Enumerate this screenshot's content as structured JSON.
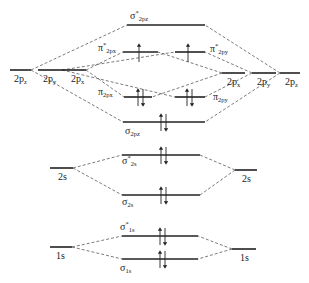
{
  "diagram": {
    "type": "molecular orbital energy-level diagram",
    "atomic_orbitals_left": [
      {
        "id": "L2pz",
        "label": "2p",
        "sub": "z"
      },
      {
        "id": "L2py",
        "label": "2p",
        "sub": "y"
      },
      {
        "id": "L2px",
        "label": "2p",
        "sub": "x"
      },
      {
        "id": "L2s",
        "label": "2s",
        "sub": ""
      },
      {
        "id": "L1s",
        "label": "1s",
        "sub": ""
      }
    ],
    "atomic_orbitals_right": [
      {
        "id": "R2px",
        "label": "2p",
        "sub": "x"
      },
      {
        "id": "R2py",
        "label": "2p",
        "sub": "y"
      },
      {
        "id": "R2pz",
        "label": "2p",
        "sub": "z"
      },
      {
        "id": "R2s",
        "label": "2s",
        "sub": ""
      },
      {
        "id": "R1s",
        "label": "1s",
        "sub": ""
      }
    ],
    "molecular_orbitals": [
      {
        "id": "sigma_star_2pz",
        "symbol": "σ",
        "star": "*",
        "sub": "2pz",
        "electrons": 0
      },
      {
        "id": "pi_star_2px",
        "symbol": "π",
        "star": "*",
        "sub": "2px",
        "electrons": 1
      },
      {
        "id": "pi_star_2py",
        "symbol": "π",
        "star": "*",
        "sub": "2py",
        "electrons": 1
      },
      {
        "id": "pi_2px",
        "symbol": "π",
        "star": "",
        "sub": "2px",
        "electrons": 2
      },
      {
        "id": "pi_2py",
        "symbol": "π",
        "star": "",
        "sub": "2py",
        "electrons": 2
      },
      {
        "id": "sigma_2pz",
        "symbol": "σ",
        "star": "",
        "sub": "2pz",
        "electrons": 2
      },
      {
        "id": "sigma_star_2s",
        "symbol": "σ",
        "star": "*",
        "sub": "2s",
        "electrons": 2
      },
      {
        "id": "sigma_2s",
        "symbol": "σ",
        "star": "",
        "sub": "2s",
        "electrons": 2
      },
      {
        "id": "sigma_star_1s",
        "symbol": "σ",
        "star": "*",
        "sub": "1s",
        "electrons": 2
      },
      {
        "id": "sigma_1s",
        "symbol": "σ",
        "star": "",
        "sub": "1s",
        "electrons": 2
      }
    ]
  }
}
